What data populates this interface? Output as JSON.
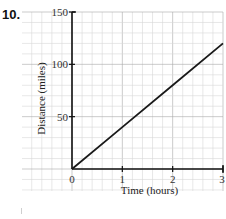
{
  "question": {
    "number": "10."
  },
  "chart_data": {
    "type": "line",
    "title": "",
    "xlabel": "Time (hours)",
    "ylabel": "Distance (miles)",
    "xlim": [
      0,
      3
    ],
    "ylim": [
      0,
      150
    ],
    "x_ticks": [
      0,
      1,
      2,
      3
    ],
    "y_ticks": [
      50,
      100,
      150
    ],
    "x_tick_labels": [
      "0",
      "1",
      "2",
      "3"
    ],
    "y_tick_labels": [
      "50",
      "100",
      "150"
    ],
    "origin_label": "0",
    "grid": true,
    "legend": null,
    "series": [
      {
        "name": "Distance",
        "x": [
          0,
          1,
          2,
          3
        ],
        "y": [
          0,
          40,
          80,
          120
        ],
        "color": "#1a1a1a"
      }
    ]
  },
  "colors": {
    "grid_minor": "#d6d6d6",
    "grid_major": "#a8a8a8",
    "axis": "#111111",
    "line": "#1a1a1a"
  }
}
